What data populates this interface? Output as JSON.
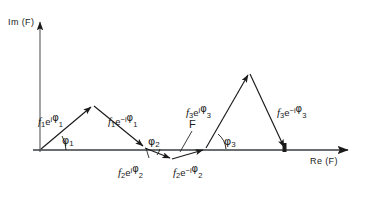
{
  "figure": {
    "kind": "argand-vector-diagram",
    "width": 365,
    "height": 197,
    "background": "#ffffff",
    "ink": "#1a1a1a"
  },
  "axes": {
    "imaginary": {
      "label_text": "Im (F)",
      "label_parts": {
        "prefix": "Im (",
        "symbol": "F",
        "suffix": ")"
      },
      "direction": "up",
      "origin": {
        "x": 40,
        "y": 150
      },
      "tip": {
        "x": 40,
        "y": 17
      }
    },
    "real": {
      "label_text": "Re (F)",
      "label_parts": {
        "prefix": "Re (",
        "symbol": "F",
        "suffix": ")"
      },
      "direction": "right",
      "origin": {
        "x": 40,
        "y": 150
      },
      "tip": {
        "x": 355,
        "y": 150
      }
    }
  },
  "resultant": {
    "symbol": "F",
    "description": "resultant along real axis"
  },
  "vectors": [
    {
      "id": "f1-up",
      "label": "f₁e^{iφ₁}",
      "mag": "f",
      "mag_sub": "1",
      "exp_sign": "i",
      "phase_sub": "1",
      "from": {
        "x": 40,
        "y": 150
      },
      "to": {
        "x": 93,
        "y": 105
      }
    },
    {
      "id": "f1-down",
      "label": "f₁e^{-iφ₁}",
      "mag": "f",
      "mag_sub": "1",
      "exp_sign": "-i",
      "phase_sub": "1",
      "from": {
        "x": 93,
        "y": 105
      },
      "to": {
        "x": 145,
        "y": 148
      }
    },
    {
      "id": "f2-up",
      "label": "f₂e^{iφ₂}",
      "mag": "f",
      "mag_sub": "2",
      "exp_sign": "i",
      "phase_sub": "2",
      "from": {
        "x": 145,
        "y": 148
      },
      "to": {
        "x": 172,
        "y": 159
      }
    },
    {
      "id": "f2-down",
      "label": "f₂e^{-iφ₂}",
      "mag": "f",
      "mag_sub": "2",
      "exp_sign": "-i",
      "phase_sub": "2",
      "from": {
        "x": 172,
        "y": 159
      },
      "to": {
        "x": 205,
        "y": 149
      }
    },
    {
      "id": "f3-up",
      "label": "f₃e^{iφ₃}",
      "mag": "f",
      "mag_sub": "3",
      "exp_sign": "i",
      "phase_sub": "3",
      "from": {
        "x": 205,
        "y": 149
      },
      "to": {
        "x": 249,
        "y": 72
      }
    },
    {
      "id": "f3-down",
      "label": "f₃e^{-iφ₃}",
      "mag": "f",
      "mag_sub": "3",
      "exp_sign": "-i",
      "phase_sub": "3",
      "from": {
        "x": 249,
        "y": 72
      },
      "to": {
        "x": 285,
        "y": 150
      }
    }
  ],
  "angles": [
    {
      "id": "phi1",
      "symbol": "φ",
      "sub": "1",
      "at": {
        "x": 40,
        "y": 150
      }
    },
    {
      "id": "phi2",
      "symbol": "φ",
      "sub": "2",
      "at": {
        "x": 145,
        "y": 148
      }
    },
    {
      "id": "phi3",
      "symbol": "φ",
      "sub": "3",
      "at": {
        "x": 205,
        "y": 149
      }
    }
  ],
  "labels": {
    "f1_up": {
      "mag": "f",
      "mag_sub": "1",
      "e": "e",
      "sign": "i",
      "phi": "φ",
      "phi_sub": "1"
    },
    "f1_down": {
      "mag": "f",
      "mag_sub": "1",
      "e": "e",
      "sign": "−i",
      "phi": "φ",
      "phi_sub": "1"
    },
    "f2_up": {
      "mag": "f",
      "mag_sub": "2",
      "e": "e",
      "sign": "i",
      "phi": "φ",
      "phi_sub": "2"
    },
    "f2_down": {
      "mag": "f",
      "mag_sub": "2",
      "e": "e",
      "sign": "−i",
      "phi": "φ",
      "phi_sub": "2"
    },
    "f3_up": {
      "mag": "f",
      "mag_sub": "3",
      "e": "e",
      "sign": "i",
      "phi": "φ",
      "phi_sub": "3"
    },
    "f3_down": {
      "mag": "f",
      "mag_sub": "3",
      "e": "e",
      "sign": "−i",
      "phi": "φ",
      "phi_sub": "3"
    },
    "phi1": {
      "phi": "φ",
      "sub": "1"
    },
    "phi2": {
      "phi": "φ",
      "sub": "2"
    },
    "phi3": {
      "phi": "φ",
      "sub": "3"
    },
    "resultant": {
      "text": "F"
    },
    "im_axis": {
      "text": "Im (F)"
    },
    "re_axis": {
      "text": "Re (F)"
    }
  }
}
